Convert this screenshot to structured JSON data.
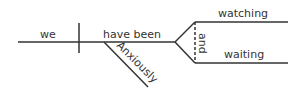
{
  "diagram": {
    "type": "sentence-diagram",
    "subject": "we",
    "verb": "have been",
    "modifier": "Anxiously",
    "conjunction": "and",
    "branches": [
      "watching",
      "waiting"
    ],
    "line_color": "#333333"
  }
}
